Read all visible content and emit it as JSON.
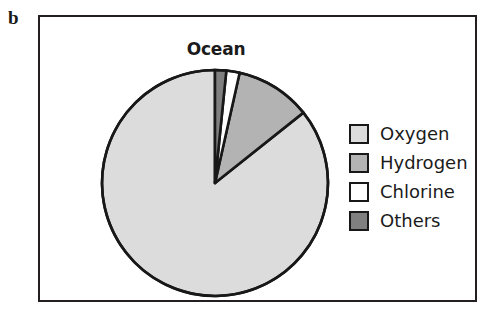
{
  "panel": {
    "letter": "b"
  },
  "chart_data": {
    "type": "pie",
    "title": "Ocean",
    "xlabel": "",
    "ylabel": "",
    "legend_position": "right",
    "grid": false,
    "start_angle_deg": 90,
    "direction": "counterclockwise",
    "categories": [
      "Oxygen",
      "Hydrogen",
      "Chlorine",
      "Others"
    ],
    "values": [
      85.7,
      10.8,
      1.9,
      1.6
    ],
    "units": "percent",
    "colors": [
      "#dcdcdc",
      "#b3b3b3",
      "#ffffff",
      "#808080"
    ],
    "slice_outline_color": "#181818",
    "slices": [
      {
        "label": "Oxygen",
        "value": 85.7,
        "color": "#dcdcdc"
      },
      {
        "label": "Hydrogen",
        "value": 10.8,
        "color": "#b3b3b3"
      },
      {
        "label": "Chlorine",
        "value": 1.9,
        "color": "#ffffff"
      },
      {
        "label": "Others",
        "value": 1.6,
        "color": "#808080"
      }
    ]
  },
  "legend": {
    "items": [
      {
        "label": "Oxygen",
        "color": "#dcdcdc"
      },
      {
        "label": "Hydrogen",
        "color": "#b3b3b3"
      },
      {
        "label": "Chlorine",
        "color": "#ffffff"
      },
      {
        "label": "Others",
        "color": "#808080"
      }
    ]
  }
}
